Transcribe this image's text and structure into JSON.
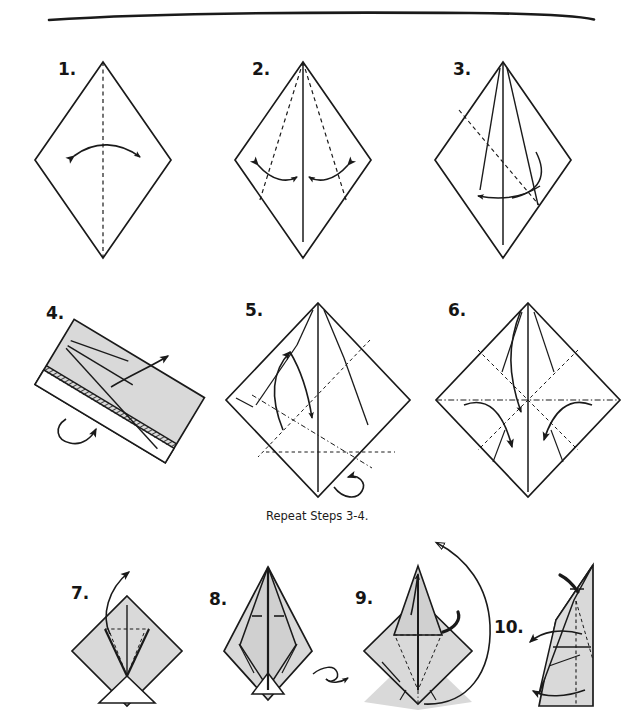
{
  "page": {
    "background_color": "#ffffff",
    "ink_color": "#1a1a1a",
    "shade_color": "#d9d9d9",
    "width": 640,
    "height": 710
  },
  "divider": {
    "name": "hand-drawn-rule",
    "label": ""
  },
  "steps": [
    {
      "id": 1,
      "label": "1.",
      "shape": "diamond",
      "note": "square rotated 45 degrees, vertical dashed valley crease, double-headed curved arrow left-right"
    },
    {
      "id": 2,
      "label": "2.",
      "shape": "diamond-kite",
      "note": "vertical solid crease with two dashed kite folds, two double-headed arrows"
    },
    {
      "id": 3,
      "label": "3.",
      "shape": "diamond-kite-folded",
      "note": "kite flaps folded in, dashed diagonal, curved arrow down-left"
    },
    {
      "id": 4,
      "label": "4.",
      "shape": "rotated-rectangle",
      "note": "shaded rectangle rotated, hatched edge, turn-over arrow and pull arrow"
    },
    {
      "id": 5,
      "label": "5.",
      "shape": "diamond-creased",
      "note": "preliminary creases, dash-dot diagonals, arrow up-left and fold arrow down, turn-over arrow"
    },
    {
      "id": 6,
      "label": "6.",
      "shape": "diamond-squash",
      "note": "horizontal dash-dot fold line, three downward arrows, dashed diagonals"
    },
    {
      "id": 7,
      "label": "7.",
      "shape": "shaded-diamond",
      "note": "grey diamond with white triangle at base, petal fold arrow up"
    },
    {
      "id": 8,
      "label": "8.",
      "shape": "petal-point",
      "note": "tall pointed petal, flip-over loop arrow to the right"
    },
    {
      "id": 9,
      "label": "9.",
      "shape": "petal-diamond",
      "note": "petal fold on shaded diamond, large sweeping arrow from bottom-right to top-left"
    },
    {
      "id": 10,
      "label": "10.",
      "shape": "narrow-upright",
      "note": "narrow upright form, two curved arrows pointing left"
    }
  ],
  "captions": [
    {
      "id": "repeat",
      "text": "Repeat Steps 3-4."
    }
  ]
}
